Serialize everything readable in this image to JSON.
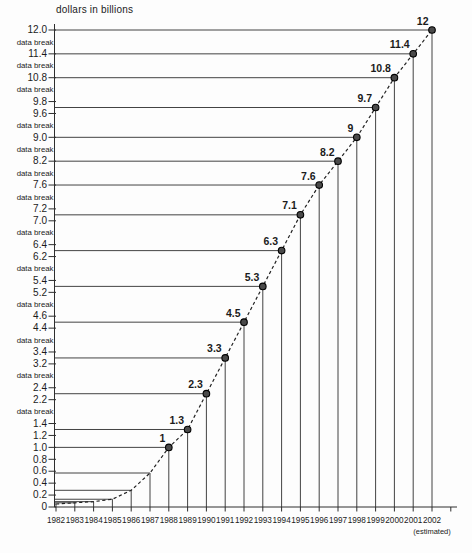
{
  "figure": {
    "title": "dollars in billions"
  },
  "chart_data": {
    "type": "line",
    "title": "dollars in billions",
    "xlabel": "",
    "ylabel": "dollars in billions",
    "ylim": [
      0,
      12
    ],
    "x": [
      1982,
      1983,
      1984,
      1985,
      1986,
      1987,
      1988,
      1989,
      1990,
      1991,
      1992,
      1993,
      1994,
      1995,
      1996,
      1997,
      1998,
      1999,
      2000,
      2001,
      2002
    ],
    "values": [
      0.05,
      0.07,
      0.09,
      0.13,
      0.28,
      0.57,
      1,
      1.3,
      2.3,
      3.3,
      4.5,
      5.3,
      6.3,
      7.1,
      7.6,
      8.2,
      9,
      9.7,
      10.8,
      11.4,
      12
    ],
    "point_labels": [
      "",
      "",
      "",
      "",
      "",
      "",
      "1",
      "1.3",
      "2.3",
      "3.3",
      "4.5",
      "5.3",
      "6.3",
      "7.1",
      "7.6",
      "8.2",
      "9",
      "9.7",
      "10.8",
      "11.4",
      "12"
    ],
    "values_note": "1982-1987 values are unlabeled in the figure; estimated from the axis",
    "x_note": {
      "year": 2002,
      "label": "(estimated)"
    },
    "data_break_label": "data break",
    "y_axis_ticks_top_to_bottom": [
      "12.0",
      "data break",
      "11.4",
      "data break",
      "10.8",
      "data break",
      "9.8",
      "9.6",
      "data break",
      "9.0",
      "data break",
      "8.2",
      "data break",
      "7.6",
      "data break",
      "7.2",
      "7.0",
      "data break",
      "6.4",
      "6.2",
      "data break",
      "5.4",
      "5.2",
      "data break",
      "4.6",
      "4.4",
      "data break",
      "3.4",
      "3.2",
      "data break",
      "2.4",
      "2.2",
      "data break",
      "1.4",
      "1.2",
      "1.0",
      "0.8",
      "0.6",
      "0.4",
      "0.2",
      "0"
    ],
    "style": {
      "line_style": "dashed",
      "marker": "filled-circle",
      "grid": "per-point horizontal and vertical drop lines",
      "ink_color": "#2e2e2e",
      "background_color": "#fdfdfd",
      "legend": "none"
    }
  }
}
